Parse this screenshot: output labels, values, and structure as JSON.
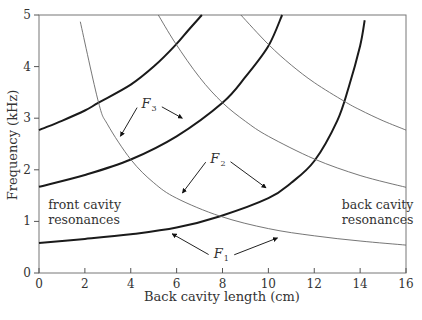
{
  "chart_data": {
    "type": "line",
    "title": "",
    "xlabel": "Back cavity length (cm)",
    "ylabel": "Frequency (kHz)",
    "xlim": [
      0,
      16
    ],
    "ylim": [
      0,
      5
    ],
    "xticks": [
      0,
      2,
      4,
      6,
      8,
      10,
      12,
      14,
      16
    ],
    "yticks": [
      0,
      1,
      2,
      3,
      4,
      5
    ],
    "grid": false,
    "series": [
      {
        "name": "F1 (coupled)",
        "style": "thick",
        "x": [
          0,
          2,
          4,
          6,
          7.9,
          10,
          11,
          12,
          13,
          13.5,
          14,
          14.2
        ],
        "y": [
          0.58,
          0.66,
          0.75,
          0.88,
          1.1,
          1.45,
          1.75,
          2.17,
          2.95,
          3.6,
          4.4,
          4.9
        ]
      },
      {
        "name": "F2 (coupled)",
        "style": "thick",
        "x": [
          0,
          2,
          4,
          6,
          8,
          9,
          10,
          10.6
        ],
        "y": [
          1.67,
          1.9,
          2.2,
          2.65,
          3.3,
          3.8,
          4.4,
          5.0
        ]
      },
      {
        "name": "F3 (coupled)",
        "style": "thick",
        "x": [
          0,
          1,
          2,
          2.6,
          4,
          5,
          5.94,
          6.5,
          7.1
        ],
        "y": [
          2.77,
          2.95,
          3.15,
          3.3,
          3.65,
          4.0,
          4.41,
          4.7,
          5.0
        ]
      },
      {
        "name": "front cavity resonance 1",
        "style": "thin",
        "x": [
          1.8,
          2.6,
          3,
          4,
          5,
          6,
          7.9,
          10,
          12,
          14,
          16
        ],
        "y": [
          4.87,
          3.3,
          2.87,
          2.2,
          1.75,
          1.45,
          1.1,
          0.86,
          0.72,
          0.62,
          0.54
        ]
      },
      {
        "name": "front cavity resonance 2",
        "style": "thin",
        "x": [
          5.2,
          5.94,
          7,
          8,
          9,
          10,
          12,
          14,
          16
        ],
        "y": [
          5.0,
          4.46,
          3.79,
          3.3,
          2.94,
          2.65,
          2.21,
          1.89,
          1.66
        ]
      },
      {
        "name": "front cavity resonance 3",
        "style": "thin",
        "x": [
          8.8,
          10,
          11,
          12,
          13.3,
          14,
          15,
          16
        ],
        "y": [
          5.0,
          4.43,
          4.03,
          3.69,
          3.33,
          3.16,
          2.95,
          2.77
        ]
      }
    ],
    "annotations": [
      {
        "text": "front cavity",
        "x": 0.4,
        "y": 1.25
      },
      {
        "text": "resonances",
        "x": 0.4,
        "y": 0.95
      },
      {
        "text": "back cavity",
        "x": 13.2,
        "y": 1.25
      },
      {
        "text": "resonances",
        "x": 13.2,
        "y": 0.95
      },
      {
        "label": "F",
        "sub": "3",
        "x": 4.8,
        "y": 3.2,
        "arrows": [
          [
            3.55,
            2.65
          ],
          [
            6.25,
            3.0
          ]
        ]
      },
      {
        "label": "F",
        "sub": "2",
        "x": 7.8,
        "y": 2.14,
        "arrows": [
          [
            6.25,
            1.55
          ],
          [
            9.9,
            1.65
          ]
        ]
      },
      {
        "label": "F",
        "sub": "1",
        "x": 7.95,
        "y": 0.3,
        "arrows": [
          [
            5.8,
            0.76
          ],
          [
            10.4,
            0.68
          ]
        ]
      }
    ]
  }
}
